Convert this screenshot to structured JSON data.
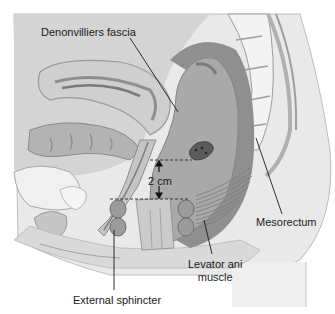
{
  "figure": {
    "type": "anatomical-sagittal-section",
    "color_mode": "grayscale"
  },
  "labels": {
    "denonvilliers_fascia": "Denonvilliers fascia",
    "mesorectum": "Mesorectum",
    "levator_ani_line1": "Levator ani",
    "levator_ani_line2": "muscle",
    "external_sphincter": "External sphincter",
    "measurement": "2 cm"
  },
  "colors": {
    "background": "#ffffff",
    "skin": "#e9e9e9",
    "tissue_light": "#d6d6d6",
    "tissue_mid": "#b9b9b9",
    "tissue_dark": "#8e8e8e",
    "rectum": "#a7a7a7",
    "bone": "#f2f2f2",
    "leader_line": "#1a1a1a"
  }
}
